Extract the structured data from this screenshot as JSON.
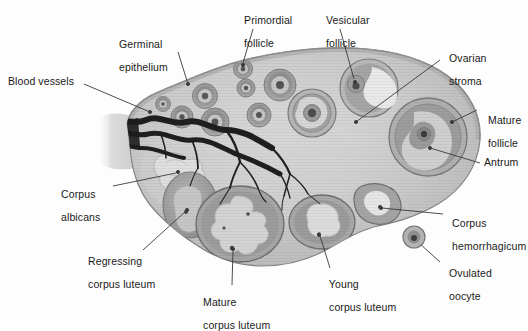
{
  "figure": {
    "type": "labeled anatomical diagram",
    "background_color": "#fdfdfd",
    "ink_color": "#1a1a1a"
  },
  "palette": {
    "stroma_light": "#d6d6d6",
    "stroma_mid": "#c2c2c2",
    "stroma_dark": "#a9a9a9",
    "cortex_band": "#b4b4b4",
    "follicle_ring": "#8f8f8f",
    "follicle_core": "#707070",
    "antrum_light": "#e4e4e4",
    "luteum_body": "#9a9a9a",
    "luteum_fold": "#bcbcbc",
    "albicans": "#dcdcdc",
    "vessel": "#262626",
    "outline": "#6e6e6e",
    "leader_line": "#3a3a3a"
  },
  "labels": [
    {
      "id": "blood-vessels",
      "text": "Blood vessels",
      "lines": [
        "Blood vessels"
      ],
      "x": 8,
      "y": 76,
      "align": "left",
      "leader": [
        [
          84,
          84
        ],
        [
          150,
          112
        ]
      ]
    },
    {
      "id": "germinal-epithelium",
      "text": "Germinal epithelium",
      "lines": [
        "Germinal",
        "epithelium"
      ],
      "x": 113,
      "y": 27,
      "align": "left",
      "leader": [
        [
          178,
          52
        ],
        [
          188,
          84
        ]
      ]
    },
    {
      "id": "primordial-follicle",
      "text": "Primordial follicle",
      "lines": [
        "Primordial",
        "follicle"
      ],
      "x": 238,
      "y": 3,
      "align": "left",
      "leader": [
        [
          253,
          29
        ],
        [
          243,
          68
        ]
      ]
    },
    {
      "id": "vesicular-follicle",
      "text": "Vesicular follicle",
      "lines": [
        "Vesicular",
        "follicle"
      ],
      "x": 320,
      "y": 3,
      "align": "left",
      "leader": [
        [
          340,
          29
        ],
        [
          352,
          64
        ]
      ]
    },
    {
      "id": "ovarian-stroma",
      "text": "Ovarian stroma",
      "lines": [
        "Ovarian",
        "stroma"
      ],
      "x": 443,
      "y": 47,
      "align": "left",
      "leader": [
        [
          440,
          60
        ],
        [
          356,
          120
        ]
      ]
    },
    {
      "id": "mature-follicle",
      "text": "Mature follicle",
      "lines": [
        "Mature",
        "follicle"
      ],
      "x": 480,
      "y": 103,
      "align": "left",
      "leader": [
        [
          477,
          110
        ],
        [
          452,
          124
        ]
      ]
    },
    {
      "id": "antrum",
      "text": "Antrum",
      "lines": [
        "Antrum"
      ],
      "x": 483,
      "y": 159,
      "align": "left",
      "leader": [
        [
          480,
          163
        ],
        [
          430,
          150
        ]
      ]
    },
    {
      "id": "corpus-albicans",
      "text": "Corpus albicans",
      "lines": [
        "Corpus",
        "albicans"
      ],
      "x": 55,
      "y": 180,
      "align": "left",
      "leader": [
        [
          113,
          186
        ],
        [
          163,
          173
        ]
      ]
    },
    {
      "id": "regressing-corpus-luteum",
      "text": "Regressing corpus luteum",
      "lines": [
        "Regressing",
        "corpus luteum"
      ],
      "x": 82,
      "y": 248,
      "align": "left",
      "leader": [
        [
          143,
          250
        ],
        [
          180,
          218
        ]
      ]
    },
    {
      "id": "mature-corpus-luteum",
      "text": "Mature corpus luteum",
      "lines": [
        "Mature",
        "corpus luteum"
      ],
      "x": 197,
      "y": 287,
      "align": "left",
      "leader": [
        [
          232,
          286
        ],
        [
          233,
          258
        ]
      ]
    },
    {
      "id": "young-corpus-luteum",
      "text": "Young corpus luteum",
      "lines": [
        "Young",
        "corpus luteum"
      ],
      "x": 323,
      "y": 271,
      "align": "left",
      "leader": [
        [
          330,
          270
        ],
        [
          319,
          238
        ]
      ]
    },
    {
      "id": "corpus-hemorrhagicum",
      "text": "Corpus hemorrhagicum",
      "lines": [
        "Corpus",
        "hemorrhagicum"
      ],
      "x": 446,
      "y": 208,
      "align": "left",
      "leader": [
        [
          443,
          214
        ],
        [
          397,
          213
        ]
      ]
    },
    {
      "id": "ovulated-oocyte",
      "text": "Ovulated oocyte",
      "lines": [
        "Ovulated",
        "oocyte"
      ],
      "x": 443,
      "y": 259,
      "align": "left",
      "leader": [
        [
          440,
          263
        ],
        [
          418,
          243
        ]
      ]
    }
  ],
  "structures": {
    "ovary_outline": "irregular ovoid mass occupying center of frame",
    "follicles_primordial_count": 11,
    "vesicular_follicle_count": 2,
    "mature_follicle_count": 1,
    "corpora_lutea": [
      "mature corpus luteum",
      "young corpus luteum",
      "regressing corpus luteum"
    ],
    "other": [
      "corpus albicans",
      "corpus hemorrhagicum",
      "ovulated oocyte",
      "hilum blood vessels"
    ]
  }
}
